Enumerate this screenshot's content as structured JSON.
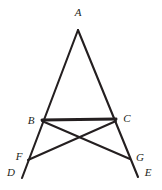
{
  "figure": {
    "background_color": "#ffffff",
    "stroke_color": "#241f20",
    "width": 162,
    "height": 190
  },
  "points": {
    "A": {
      "label": "A",
      "x": 78,
      "y": 30,
      "label_x": 78,
      "label_y": 12
    },
    "B": {
      "label": "B",
      "x": 42,
      "y": 120,
      "label_x": 31,
      "label_y": 120
    },
    "C": {
      "label": "C",
      "x": 116,
      "y": 119,
      "label_x": 127,
      "label_y": 118
    },
    "F": {
      "label": "F",
      "x": 28,
      "y": 160,
      "label_x": 19,
      "label_y": 156
    },
    "G": {
      "label": "G",
      "x": 130,
      "y": 159,
      "label_x": 140,
      "label_y": 157
    },
    "D": {
      "label": "D",
      "x": 22,
      "y": 178,
      "label_x": 11,
      "label_y": 172
    },
    "E": {
      "label": "E",
      "x": 138,
      "y": 177,
      "label_x": 148,
      "label_y": 172
    }
  },
  "segments": [
    {
      "name": "side-AD",
      "from": "A",
      "to": "D",
      "d": "M 78 30 L 22 178",
      "width": 2.1
    },
    {
      "name": "side-AE",
      "from": "A",
      "to": "E",
      "d": "M 78 30 L 138 177",
      "width": 2.1
    },
    {
      "name": "base-BC",
      "from": "B",
      "to": "C",
      "d": "M 42 120 L 116 119",
      "width": 3.0
    },
    {
      "name": "cevian-BG",
      "from": "B",
      "to": "G",
      "d": "M 42 121 L 130 159",
      "width": 2.0
    },
    {
      "name": "cevian-CF",
      "from": "C",
      "to": "F",
      "d": "M 116 121 L 28 160",
      "width": 2.0
    }
  ]
}
